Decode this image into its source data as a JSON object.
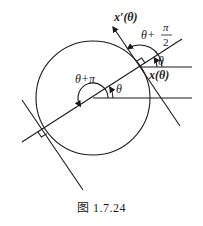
{
  "figure": {
    "caption": "图 1.7.24",
    "labels": {
      "x_prime": "x′(θ)",
      "x": "x(θ)",
      "theta_center": "θ",
      "theta_tangent": "θ",
      "theta_plus_pi": "θ+π",
      "theta_plus_half_pi_num": "π",
      "theta_plus_half_pi_prefix": "θ+",
      "theta_plus_half_pi_den": "2"
    },
    "elements": [
      "circle",
      "horizontal-ray-center",
      "horizontal-ray-tangent",
      "diameter-line",
      "tangent-line-upper-right",
      "tangent-line-lower-left",
      "right-angle-markers",
      "angle-arcs"
    ],
    "stroke_color": "#1a1a1a"
  }
}
